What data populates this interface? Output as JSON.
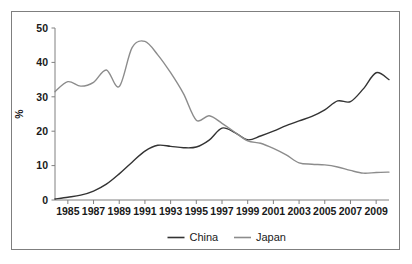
{
  "chart_data": {
    "type": "line",
    "title": "",
    "subtitle": "",
    "xlabel": "",
    "ylabel": "%",
    "xlim": [
      1984,
      2010
    ],
    "ylim": [
      0,
      50
    ],
    "grid": false,
    "legend_position": "bottom",
    "x": [
      1984,
      1985,
      1986,
      1987,
      1988,
      1989,
      1990,
      1991,
      1992,
      1993,
      1994,
      1995,
      1996,
      1997,
      1998,
      1999,
      2000,
      2001,
      2002,
      2003,
      2004,
      2005,
      2006,
      2007,
      2008,
      2009,
      2010
    ],
    "xtick_labels": [
      "1985",
      "1987",
      "1989",
      "1991",
      "1993",
      "1995",
      "1997",
      "1999",
      "2001",
      "2003",
      "2005",
      "2007",
      "2009"
    ],
    "xtick_values": [
      1985,
      1987,
      1989,
      1991,
      1993,
      1995,
      1997,
      1999,
      2001,
      2003,
      2005,
      2007,
      2009
    ],
    "ytick_labels": [
      "0",
      "10",
      "20",
      "30",
      "40",
      "50"
    ],
    "ytick_values": [
      0,
      10,
      20,
      30,
      40,
      50
    ],
    "series": [
      {
        "name": "China",
        "color": "#333333",
        "values": [
          0.3,
          0.8,
          1.4,
          2.6,
          4.6,
          7.6,
          11.0,
          14.2,
          15.9,
          15.6,
          15.2,
          15.4,
          17.4,
          20.9,
          19.6,
          17.5,
          18.6,
          20.0,
          21.6,
          23.0,
          24.3,
          26.2,
          28.8,
          28.6,
          32.3,
          37.0,
          35.0
        ]
      },
      {
        "name": "Japan",
        "color": "#8c8c8c",
        "values": [
          31.5,
          34.4,
          33.1,
          34.2,
          37.8,
          33.0,
          44.3,
          46.1,
          42.2,
          37.0,
          30.9,
          23.2,
          24.5,
          22.3,
          19.7,
          17.2,
          16.5,
          15.0,
          13.1,
          10.8,
          10.4,
          10.2,
          9.6,
          8.6,
          7.8,
          8.0,
          8.1
        ]
      }
    ]
  },
  "legend": {
    "items": [
      {
        "label": "China",
        "color": "#333333"
      },
      {
        "label": "Japan",
        "color": "#8c8c8c"
      }
    ]
  }
}
